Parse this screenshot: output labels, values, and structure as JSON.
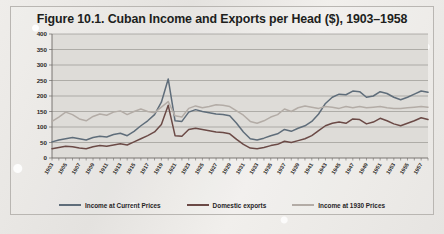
{
  "figure": {
    "title": "Figure 10.1. Cuban Income and Exports per Head ($), 1903–1958"
  },
  "legend": {
    "items": [
      {
        "label": "Income at Current Prices",
        "color": "#5f6d7a"
      },
      {
        "label": "Domestic exports",
        "color": "#6b4a46"
      },
      {
        "label": "Income at 1930 Prices",
        "color": "#b3aca6"
      }
    ]
  },
  "colors": {
    "plot_background": "#dedcd8",
    "gridline": "#8e8b87",
    "axis": "#6d6a66",
    "frame": "#b9b6b2",
    "text": "#201e1c"
  },
  "chart_data": {
    "type": "line",
    "title": "Figure 10.1. Cuban Income and Exports per Head ($), 1903–1958",
    "xlabel": "",
    "ylabel": "",
    "ylim": [
      0,
      400
    ],
    "ytick_step": 50,
    "yticks": [
      0,
      50,
      100,
      150,
      200,
      250,
      300,
      350,
      400
    ],
    "grid": true,
    "legend_position": "bottom",
    "x": [
      1903,
      1904,
      1905,
      1906,
      1907,
      1908,
      1909,
      1910,
      1911,
      1912,
      1913,
      1914,
      1915,
      1916,
      1917,
      1918,
      1919,
      1920,
      1921,
      1922,
      1923,
      1924,
      1925,
      1926,
      1927,
      1928,
      1929,
      1930,
      1931,
      1932,
      1933,
      1934,
      1935,
      1936,
      1937,
      1938,
      1939,
      1940,
      1941,
      1942,
      1943,
      1944,
      1945,
      1946,
      1947,
      1948,
      1949,
      1950,
      1951,
      1952,
      1953,
      1954,
      1955,
      1956,
      1957,
      1958
    ],
    "xtick_labels": [
      1903,
      1905,
      1907,
      1909,
      1911,
      1913,
      1915,
      1917,
      1919,
      1921,
      1923,
      1925,
      1927,
      1929,
      1931,
      1933,
      1935,
      1937,
      1939,
      1941,
      1943,
      1945,
      1947,
      1949,
      1951,
      1953,
      1955,
      1957
    ],
    "series": [
      {
        "name": "Income at Current Prices",
        "color": "#5f6d7a",
        "values": [
          52,
          58,
          62,
          66,
          62,
          58,
          66,
          70,
          68,
          76,
          80,
          72,
          86,
          104,
          120,
          140,
          180,
          255,
          120,
          118,
          148,
          156,
          150,
          146,
          142,
          140,
          136,
          112,
          84,
          62,
          58,
          64,
          72,
          78,
          92,
          86,
          96,
          104,
          118,
          142,
          176,
          196,
          206,
          204,
          216,
          214,
          196,
          200,
          214,
          208,
          196,
          188,
          196,
          206,
          216,
          212
        ]
      },
      {
        "name": "Domestic exports",
        "color": "#6b4a46",
        "values": [
          30,
          34,
          38,
          36,
          32,
          30,
          36,
          40,
          38,
          42,
          46,
          42,
          52,
          62,
          72,
          84,
          108,
          170,
          72,
          70,
          92,
          96,
          92,
          88,
          84,
          82,
          78,
          60,
          44,
          32,
          30,
          34,
          40,
          44,
          54,
          50,
          56,
          62,
          72,
          88,
          104,
          112,
          116,
          112,
          126,
          124,
          110,
          116,
          128,
          120,
          110,
          104,
          112,
          120,
          130,
          124
        ]
      },
      {
        "name": "Income at 1930 Prices",
        "color": "#b3aca6",
        "values": [
          118,
          132,
          148,
          140,
          126,
          120,
          134,
          142,
          138,
          148,
          152,
          140,
          150,
          158,
          150,
          146,
          164,
          182,
          136,
          132,
          160,
          168,
          162,
          166,
          172,
          170,
          166,
          152,
          138,
          118,
          112,
          120,
          132,
          140,
          158,
          150,
          162,
          168,
          164,
          160,
          166,
          164,
          160,
          166,
          162,
          166,
          162,
          164,
          166,
          162,
          160,
          160,
          162,
          164,
          166,
          164
        ]
      }
    ],
    "annotations": [
      {
        "text": "peak at 1920 (Dance of the Millions)",
        "x": 1920
      }
    ]
  }
}
